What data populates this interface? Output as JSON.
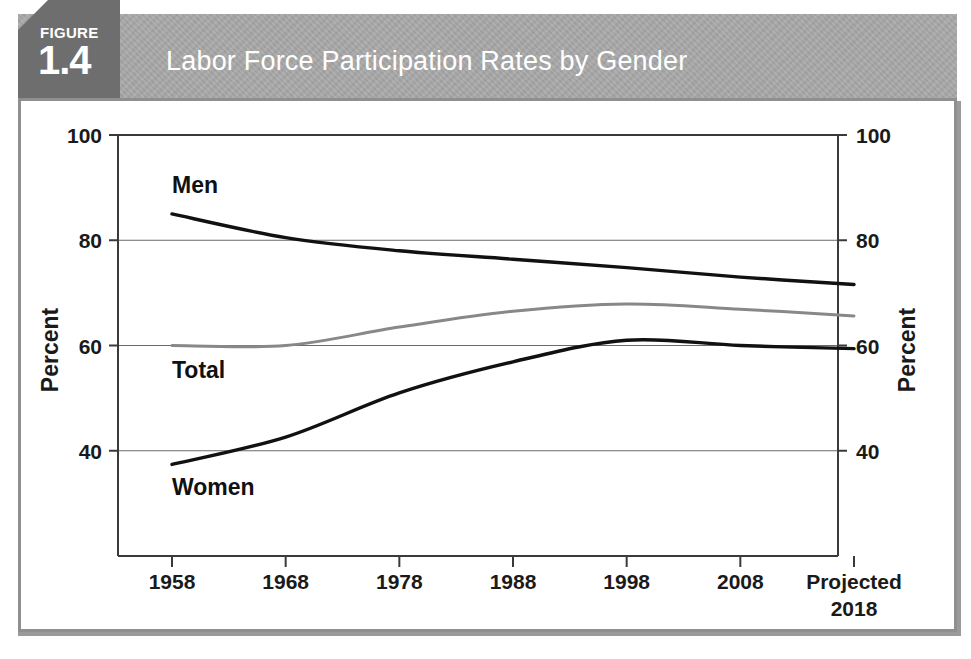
{
  "figure": {
    "badge_word": "FIGURE",
    "badge_number": "1.4",
    "title": "Labor Force Participation Rates by Gender"
  },
  "colors": {
    "header_band": "#a9a9a9",
    "badge": "#6e6e6e",
    "panel_border": "#8f8f8f",
    "men_line": "#111111",
    "women_line": "#111111",
    "total_line": "#888888",
    "gridline": "#6a6a6a"
  },
  "axes": {
    "left_title": "Percent",
    "right_title": "Percent",
    "y_ticks": [
      "100",
      "80",
      "60",
      "40"
    ],
    "x_ticks": [
      "1958",
      "1968",
      "1978",
      "1988",
      "1998",
      "2008",
      "Projected"
    ],
    "x_last_second_line": "2018"
  },
  "series_labels": {
    "men": "Men",
    "total": "Total",
    "women": "Women"
  },
  "chart_data": {
    "type": "line",
    "title": "Labor Force Participation Rates by Gender",
    "xlabel": "",
    "ylabel": "Percent",
    "ylim": [
      20,
      100
    ],
    "y_ticks": [
      40,
      60,
      80,
      100
    ],
    "grid": true,
    "legend": "inline-labels",
    "categories": [
      "1958",
      "1968",
      "1978",
      "1988",
      "1998",
      "2008",
      "Projected 2018"
    ],
    "x": [
      1958,
      1968,
      1978,
      1988,
      1998,
      2008,
      2018
    ],
    "series": [
      {
        "name": "Men",
        "color": "#111111",
        "values": [
          85.0,
          80.5,
          78.0,
          76.4,
          74.8,
          73.0,
          71.6
        ]
      },
      {
        "name": "Total",
        "color": "#888888",
        "values": [
          60.0,
          60.0,
          63.5,
          66.5,
          67.9,
          66.9,
          65.6
        ]
      },
      {
        "name": "Women",
        "color": "#111111",
        "values": [
          37.4,
          42.6,
          51.0,
          56.9,
          61.0,
          60.0,
          59.4
        ]
      }
    ]
  }
}
